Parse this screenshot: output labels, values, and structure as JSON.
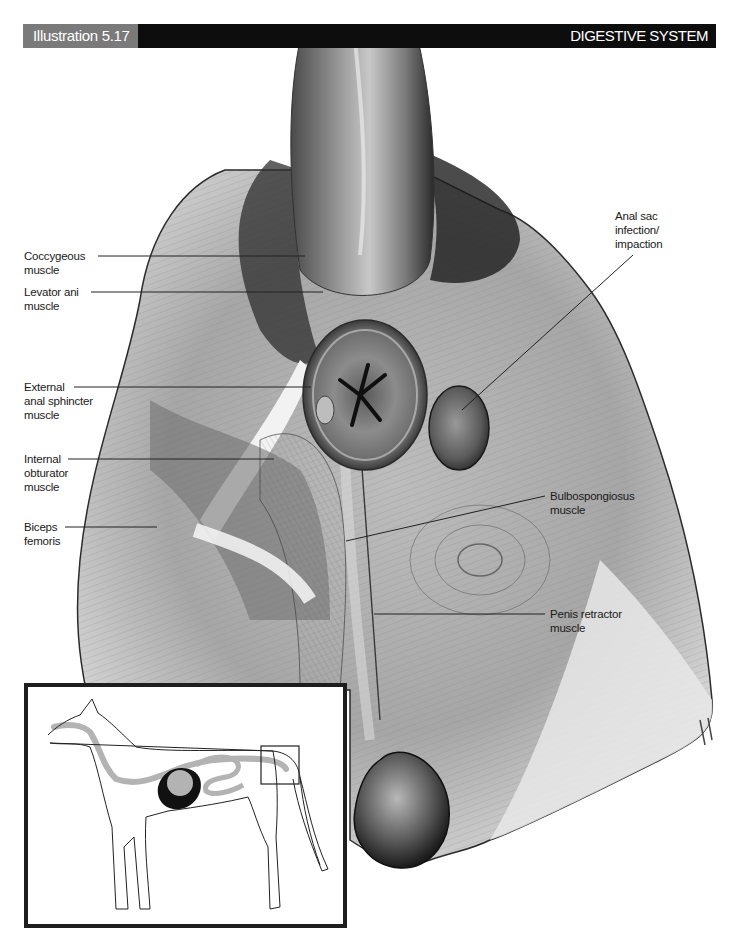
{
  "header": {
    "illustration_number": "Illustration 5.17",
    "section_title": "DIGESTIVE SYSTEM",
    "tab_color": "#7a7a7a",
    "bar_color": "#0d0d0d"
  },
  "labels": {
    "coccygeous": {
      "line1": "Coccygeous",
      "line2": "muscle"
    },
    "levator_ani": {
      "line1": "Levator ani",
      "line2": "muscle"
    },
    "external_anal_sphincter": {
      "line1": "External",
      "line2": "anal sphincter",
      "line3": "muscle"
    },
    "internal_obturator": {
      "line1": "Internal",
      "line2": "obturator",
      "line3": "muscle"
    },
    "biceps_femoris": {
      "line1": "Biceps",
      "line2": "femoris"
    },
    "anal_sac": {
      "line1": "Anal sac",
      "line2": "infection/",
      "line3": "impaction"
    },
    "bulbospongiosus": {
      "line1": "Bulbospongiosus",
      "line2": "muscle"
    },
    "penis_retractor": {
      "line1": "Penis retractor",
      "line2": "muscle"
    }
  },
  "inset": {
    "description": "Dog silhouette with digestive tract highlighted; box marks perineal region",
    "tract_color": "#b3b3b3",
    "liver_color": "#111111"
  }
}
